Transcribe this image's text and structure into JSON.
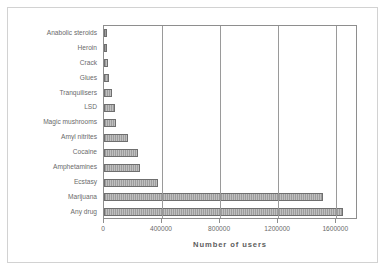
{
  "chart_data": {
    "type": "bar",
    "orientation": "horizontal",
    "title": "",
    "xlabel": "Number of users",
    "ylabel": "",
    "xlim": [
      0,
      1750000
    ],
    "grid": true,
    "legend": false,
    "xticks": [
      "0",
      "400000",
      "800000",
      "1200000",
      "1600000"
    ],
    "xtickvalues": [
      0,
      400000,
      800000,
      1200000,
      1600000
    ],
    "categories": [
      "Anabolic steroids",
      "Heroin",
      "Crack",
      "Glues",
      "Tranquilisers",
      "LSD",
      "Magic mushrooms",
      "Amyl nitrites",
      "Cocaine",
      "Amphetamines",
      "Ecstasy",
      "Marijuana",
      "Any drug"
    ],
    "values": [
      20000,
      22000,
      25000,
      35000,
      55000,
      75000,
      85000,
      165000,
      235000,
      245000,
      375000,
      1510000,
      1650000
    ]
  },
  "style": {
    "bar_fill": "#b0b0b0",
    "bar_border": "#6f6f6f",
    "grid_color": "#9a9a9a",
    "axis_color": "#8e8e8e",
    "text_color": "#6a6a6a",
    "frame_border": "#d2d2d2",
    "background": "#ffffff"
  }
}
